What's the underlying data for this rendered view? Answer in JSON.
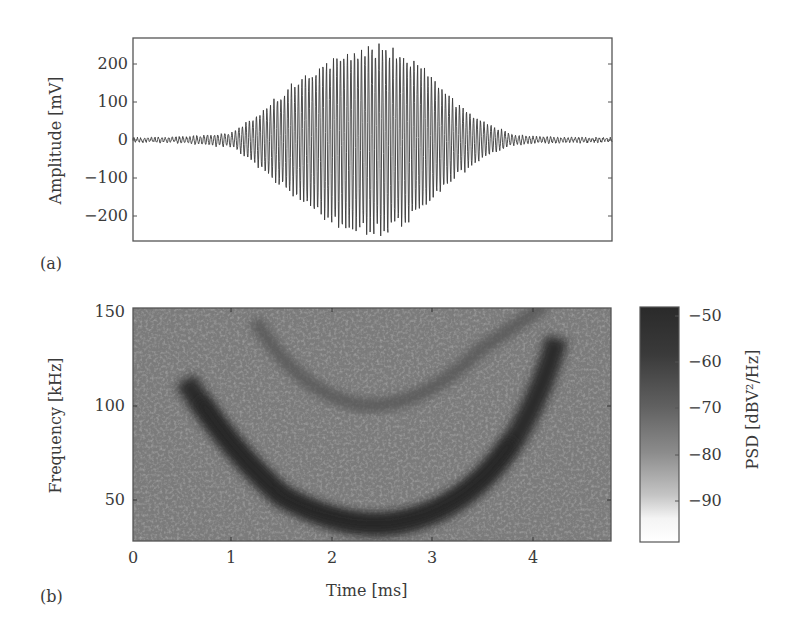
{
  "figure": {
    "panel_a": {
      "label": "(a)",
      "ylabel": "Amplitude [mV]",
      "yticks": [
        "200",
        "100",
        "0",
        "−100",
        "−200"
      ]
    },
    "panel_b": {
      "label": "(b)",
      "xlabel": "Time [ms]",
      "ylabel": "Frequency [kHz]",
      "xticks": [
        "0",
        "1",
        "2",
        "3",
        "4"
      ],
      "yticks": [
        "150",
        "100",
        "50"
      ],
      "colorbar": {
        "label": "PSD [dBV²/Hz]",
        "ticks": [
          "−50",
          "−60",
          "−70",
          "−80",
          "−90"
        ]
      }
    }
  },
  "chart_data": [
    {
      "type": "line",
      "title": "",
      "xlabel": "Time [ms]",
      "ylabel": "Amplitude [mV]",
      "xlim": [
        0,
        4.8
      ],
      "ylim": [
        -260,
        260
      ],
      "grid": false,
      "series": [
        {
          "name": "signal envelope (approx.)",
          "x": [
            0,
            0.5,
            1.0,
            1.2,
            1.5,
            1.8,
            2.0,
            2.2,
            2.4,
            2.6,
            2.8,
            3.0,
            3.2,
            3.5,
            3.8,
            4.0,
            4.8
          ],
          "envelope_mV": [
            5,
            8,
            20,
            60,
            130,
            190,
            230,
            245,
            258,
            250,
            220,
            170,
            110,
            50,
            15,
            8,
            5
          ]
        }
      ],
      "description": "Oscillating burst with Gaussian-like envelope, peak approx. ±255 mV near 2.4 ms"
    },
    {
      "type": "heatmap",
      "title": "",
      "xlabel": "Time [ms]",
      "ylabel": "Frequency [kHz]",
      "xlim": [
        0,
        4.8
      ],
      "ylim": [
        30,
        150
      ],
      "colorbar_label": "PSD [dBV²/Hz]",
      "colorbar_range": [
        -100,
        -48
      ],
      "colorbar_ticks": [
        -50,
        -60,
        -70,
        -80,
        -90
      ],
      "background_level_dB": -68,
      "features": [
        {
          "name": "fundamental",
          "level_dB": -52,
          "path_ms_kHz": [
            [
              0.55,
              110
            ],
            [
              1.0,
              80
            ],
            [
              1.5,
              58
            ],
            [
              2.0,
              48
            ],
            [
              2.4,
              45
            ],
            [
              2.8,
              47
            ],
            [
              3.2,
              55
            ],
            [
              3.6,
              72
            ],
            [
              4.0,
              100
            ],
            [
              4.25,
              128
            ]
          ]
        },
        {
          "name": "harmonic",
          "level_dB": -62,
          "path_ms_kHz": [
            [
              1.3,
              130
            ],
            [
              1.8,
              108
            ],
            [
              2.3,
              95
            ],
            [
              2.8,
              98
            ],
            [
              3.3,
              112
            ],
            [
              3.8,
              130
            ]
          ]
        }
      ]
    }
  ]
}
